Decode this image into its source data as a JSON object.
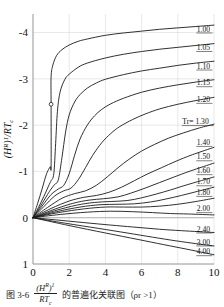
{
  "figure": {
    "caption_number": "图 3-6",
    "caption_fraction_numerator": "(H R ) 1",
    "caption_fraction_denominator": "RTc",
    "caption_tail": "的普遍化关联图（ρr >1）"
  },
  "chart_data": {
    "type": "line",
    "title": "",
    "xlabel": "pr",
    "ylabel": "(HR)1/RTc",
    "xlim": [
      0,
      10
    ],
    "ylim": [
      1,
      -4.4
    ],
    "grid": true,
    "legend_position": "inline-right-end-labels",
    "xticks": [
      0,
      2,
      4,
      6,
      8,
      10
    ],
    "xtick_labels": [
      "0",
      "2",
      "4",
      "6",
      "8",
      "10"
    ],
    "yticks": [
      -4,
      -3,
      -2,
      -1,
      0,
      1
    ],
    "ytick_labels": [
      "-4",
      "-3",
      "-2",
      "-1",
      "0",
      "1"
    ],
    "parameter_name": "Tr",
    "parameter_label_inline": "Tr= 1.30",
    "critical_point_marker": {
      "pr": 1.0,
      "value": -2.45,
      "style": "open-circle"
    },
    "series": [
      {
        "name": "1.00",
        "label": "1.00",
        "label_xy": [
          9.05,
          -4.02
        ],
        "points": [
          [
            0,
            0
          ],
          [
            0.25,
            -0.3
          ],
          [
            0.5,
            -0.62
          ],
          [
            0.75,
            -0.95
          ],
          [
            0.95,
            -1.1
          ],
          [
            1.0,
            -1.12
          ],
          [
            1.0,
            -2.45
          ],
          [
            1.0,
            -3.05
          ],
          [
            1.1,
            -3.3
          ],
          [
            1.3,
            -3.5
          ],
          [
            1.6,
            -3.63
          ],
          [
            2.0,
            -3.73
          ],
          [
            2.5,
            -3.81
          ],
          [
            3,
            -3.86
          ],
          [
            4,
            -3.94
          ],
          [
            5,
            -3.99
          ],
          [
            6,
            -4.03
          ],
          [
            7,
            -4.07
          ],
          [
            8,
            -4.1
          ],
          [
            9,
            -4.13
          ],
          [
            10,
            -4.16
          ]
        ]
      },
      {
        "name": "1.05",
        "label": "1.05",
        "label_xy": [
          9.05,
          -3.62
        ],
        "points": [
          [
            0,
            0
          ],
          [
            0.3,
            -0.22
          ],
          [
            0.6,
            -0.46
          ],
          [
            0.9,
            -0.72
          ],
          [
            1.0,
            -0.8
          ],
          [
            1.15,
            -0.95
          ],
          [
            1.25,
            -1.6
          ],
          [
            1.35,
            -2.3
          ],
          [
            1.5,
            -2.72
          ],
          [
            1.75,
            -2.98
          ],
          [
            2.0,
            -3.1
          ],
          [
            2.5,
            -3.25
          ],
          [
            3,
            -3.34
          ],
          [
            4,
            -3.45
          ],
          [
            5,
            -3.53
          ],
          [
            6,
            -3.59
          ],
          [
            7,
            -3.64
          ],
          [
            8,
            -3.68
          ],
          [
            9,
            -3.72
          ],
          [
            10,
            -3.76
          ]
        ]
      },
      {
        "name": "1.10",
        "label": "1.10",
        "label_xy": [
          9.05,
          -3.22
        ],
        "points": [
          [
            0,
            0
          ],
          [
            0.4,
            -0.24
          ],
          [
            0.8,
            -0.5
          ],
          [
            1.0,
            -0.62
          ],
          [
            1.2,
            -0.72
          ],
          [
            1.4,
            -0.82
          ],
          [
            1.6,
            -1.3
          ],
          [
            1.8,
            -1.85
          ],
          [
            2.0,
            -2.22
          ],
          [
            2.3,
            -2.5
          ],
          [
            2.6,
            -2.66
          ],
          [
            3,
            -2.8
          ],
          [
            3.5,
            -2.91
          ],
          [
            4,
            -2.99
          ],
          [
            5,
            -3.09
          ],
          [
            6,
            -3.17
          ],
          [
            7,
            -3.23
          ],
          [
            8,
            -3.29
          ],
          [
            9,
            -3.34
          ],
          [
            10,
            -3.38
          ]
        ]
      },
      {
        "name": "1.15",
        "label": "1.15",
        "label_xy": [
          9.05,
          -2.86
        ],
        "points": [
          [
            0,
            0
          ],
          [
            0.5,
            -0.25
          ],
          [
            1.0,
            -0.5
          ],
          [
            1.4,
            -0.62
          ],
          [
            1.7,
            -0.7
          ],
          [
            2.0,
            -0.95
          ],
          [
            2.3,
            -1.35
          ],
          [
            2.6,
            -1.7
          ],
          [
            3.0,
            -2.0
          ],
          [
            3.4,
            -2.2
          ],
          [
            3.8,
            -2.34
          ],
          [
            4.3,
            -2.46
          ],
          [
            5,
            -2.58
          ],
          [
            6,
            -2.71
          ],
          [
            7,
            -2.8
          ],
          [
            8,
            -2.87
          ],
          [
            9,
            -2.93
          ],
          [
            10,
            -2.98
          ]
        ]
      },
      {
        "name": "1.20",
        "label": "1.20",
        "label_xy": [
          9.05,
          -2.5
        ],
        "points": [
          [
            0,
            0
          ],
          [
            0.6,
            -0.24
          ],
          [
            1.2,
            -0.47
          ],
          [
            1.7,
            -0.58
          ],
          [
            2.1,
            -0.64
          ],
          [
            2.5,
            -0.82
          ],
          [
            2.9,
            -1.08
          ],
          [
            3.3,
            -1.35
          ],
          [
            3.8,
            -1.62
          ],
          [
            4.3,
            -1.82
          ],
          [
            4.8,
            -1.97
          ],
          [
            5.5,
            -2.12
          ],
          [
            6.2,
            -2.24
          ],
          [
            7,
            -2.35
          ],
          [
            8,
            -2.45
          ],
          [
            9,
            -2.53
          ],
          [
            10,
            -2.6
          ]
        ]
      },
      {
        "name": "1.30",
        "label": "Tr= 1.30",
        "label_xy": [
          8.25,
          -2.02
        ],
        "points": [
          [
            0,
            0
          ],
          [
            0.8,
            -0.22
          ],
          [
            1.6,
            -0.42
          ],
          [
            2.3,
            -0.52
          ],
          [
            2.9,
            -0.58
          ],
          [
            3.5,
            -0.7
          ],
          [
            4.1,
            -0.88
          ],
          [
            4.7,
            -1.08
          ],
          [
            5.3,
            -1.26
          ],
          [
            6.0,
            -1.44
          ],
          [
            6.7,
            -1.58
          ],
          [
            7.5,
            -1.72
          ],
          [
            8.3,
            -1.83
          ],
          [
            9.2,
            -1.94
          ],
          [
            10,
            -2.02
          ]
        ]
      },
      {
        "name": "1.40",
        "label": "1.40",
        "label_xy": [
          9.05,
          -1.57
        ],
        "points": [
          [
            0,
            0
          ],
          [
            1.0,
            -0.2
          ],
          [
            2.0,
            -0.36
          ],
          [
            2.8,
            -0.44
          ],
          [
            3.5,
            -0.48
          ],
          [
            4.2,
            -0.55
          ],
          [
            4.9,
            -0.66
          ],
          [
            5.6,
            -0.8
          ],
          [
            6.3,
            -0.94
          ],
          [
            7.1,
            -1.08
          ],
          [
            7.9,
            -1.22
          ],
          [
            8.8,
            -1.36
          ],
          [
            10,
            -1.52
          ]
        ]
      },
      {
        "name": "1.50",
        "label": "1.50",
        "label_xy": [
          9.05,
          -1.26
        ],
        "points": [
          [
            0,
            0
          ],
          [
            1.1,
            -0.17
          ],
          [
            2.2,
            -0.31
          ],
          [
            3.1,
            -0.38
          ],
          [
            3.9,
            -0.41
          ],
          [
            4.7,
            -0.45
          ],
          [
            5.4,
            -0.53
          ],
          [
            6.2,
            -0.64
          ],
          [
            7.0,
            -0.76
          ],
          [
            7.8,
            -0.88
          ],
          [
            8.7,
            -1.01
          ],
          [
            10,
            -1.18
          ]
        ]
      },
      {
        "name": "1.60",
        "label": "1.60",
        "label_xy": [
          9.05,
          -0.96
        ],
        "points": [
          [
            0,
            0
          ],
          [
            1.2,
            -0.15
          ],
          [
            2.4,
            -0.27
          ],
          [
            3.4,
            -0.33
          ],
          [
            4.3,
            -0.35
          ],
          [
            5.2,
            -0.37
          ],
          [
            6.0,
            -0.43
          ],
          [
            6.8,
            -0.51
          ],
          [
            7.6,
            -0.6
          ],
          [
            8.5,
            -0.71
          ],
          [
            10,
            -0.88
          ]
        ]
      },
      {
        "name": "1.70",
        "label": "1.70",
        "label_xy": [
          9.05,
          -0.72
        ],
        "points": [
          [
            0,
            0
          ],
          [
            1.3,
            -0.13
          ],
          [
            2.6,
            -0.23
          ],
          [
            3.7,
            -0.28
          ],
          [
            4.7,
            -0.29
          ],
          [
            5.6,
            -0.3
          ],
          [
            6.5,
            -0.34
          ],
          [
            7.3,
            -0.4
          ],
          [
            8.2,
            -0.48
          ],
          [
            9.1,
            -0.57
          ],
          [
            10,
            -0.66
          ]
        ]
      },
      {
        "name": "1.80",
        "label": "1.80",
        "label_xy": [
          9.05,
          -0.49
        ],
        "points": [
          [
            0,
            0
          ],
          [
            1.4,
            -0.11
          ],
          [
            2.8,
            -0.19
          ],
          [
            4.0,
            -0.23
          ],
          [
            5.0,
            -0.23
          ],
          [
            6.0,
            -0.23
          ],
          [
            7.0,
            -0.25
          ],
          [
            8.0,
            -0.29
          ],
          [
            9.0,
            -0.35
          ],
          [
            10,
            -0.42
          ]
        ]
      },
      {
        "name": "2.00",
        "label": "2.00",
        "label_xy": [
          9.05,
          -0.14
        ],
        "points": [
          [
            0,
            0
          ],
          [
            1.5,
            -0.07
          ],
          [
            3.0,
            -0.12
          ],
          [
            4.3,
            -0.14
          ],
          [
            5.5,
            -0.13
          ],
          [
            6.6,
            -0.11
          ],
          [
            7.6,
            -0.09
          ],
          [
            8.6,
            -0.08
          ],
          [
            10,
            -0.06
          ]
        ]
      },
      {
        "name": "2.40",
        "label": "2.40",
        "label_xy": [
          9.05,
          0.3
        ],
        "points": [
          [
            0,
            0
          ],
          [
            1.6,
            0.06
          ],
          [
            3.2,
            0.12
          ],
          [
            4.6,
            0.17
          ],
          [
            5.8,
            0.21
          ],
          [
            7.0,
            0.25
          ],
          [
            8.2,
            0.28
          ],
          [
            10,
            0.32
          ]
        ]
      },
      {
        "name": "3.00",
        "label": "3.00",
        "label_xy": [
          9.05,
          0.58
        ],
        "points": [
          [
            0,
            0
          ],
          [
            1.8,
            0.12
          ],
          [
            3.6,
            0.23
          ],
          [
            5.2,
            0.33
          ],
          [
            6.6,
            0.42
          ],
          [
            7.9,
            0.5
          ],
          [
            9.0,
            0.56
          ],
          [
            10,
            0.61
          ]
        ]
      },
      {
        "name": "4.00",
        "label": "4.00",
        "label_xy": [
          9.05,
          0.79
        ],
        "points": [
          [
            0,
            0
          ],
          [
            2.0,
            0.17
          ],
          [
            4.0,
            0.33
          ],
          [
            5.8,
            0.47
          ],
          [
            7.2,
            0.58
          ],
          [
            8.5,
            0.68
          ],
          [
            10,
            0.8
          ]
        ]
      }
    ]
  }
}
